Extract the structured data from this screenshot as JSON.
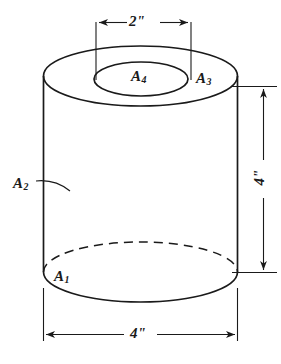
{
  "figure": {
    "shape": "hollow-cylinder",
    "line_color": "#1a1a1a",
    "background_color": "#ffffff",
    "area_labels": [
      {
        "id": "a1",
        "text": "A",
        "subscript": "1",
        "description": "bottom face area"
      },
      {
        "id": "a2",
        "text": "A",
        "subscript": "2",
        "description": "outer lateral surface area"
      },
      {
        "id": "a3",
        "text": "A",
        "subscript": "3",
        "description": "top annular face area"
      },
      {
        "id": "a4",
        "text": "A",
        "subscript": "4",
        "description": "inner bore opening area"
      }
    ],
    "dimensions": [
      {
        "id": "top",
        "label": "2\"",
        "orientation": "horizontal",
        "position": "top",
        "measures": "inner bore diameter",
        "arrows": "inward"
      },
      {
        "id": "right",
        "label": "4\"",
        "orientation": "vertical",
        "position": "right",
        "measures": "cylinder height",
        "arrows": "outward"
      },
      {
        "id": "bottom",
        "label": "4\"",
        "orientation": "horizontal",
        "position": "bottom",
        "measures": "outer diameter",
        "arrows": "outward"
      }
    ]
  }
}
